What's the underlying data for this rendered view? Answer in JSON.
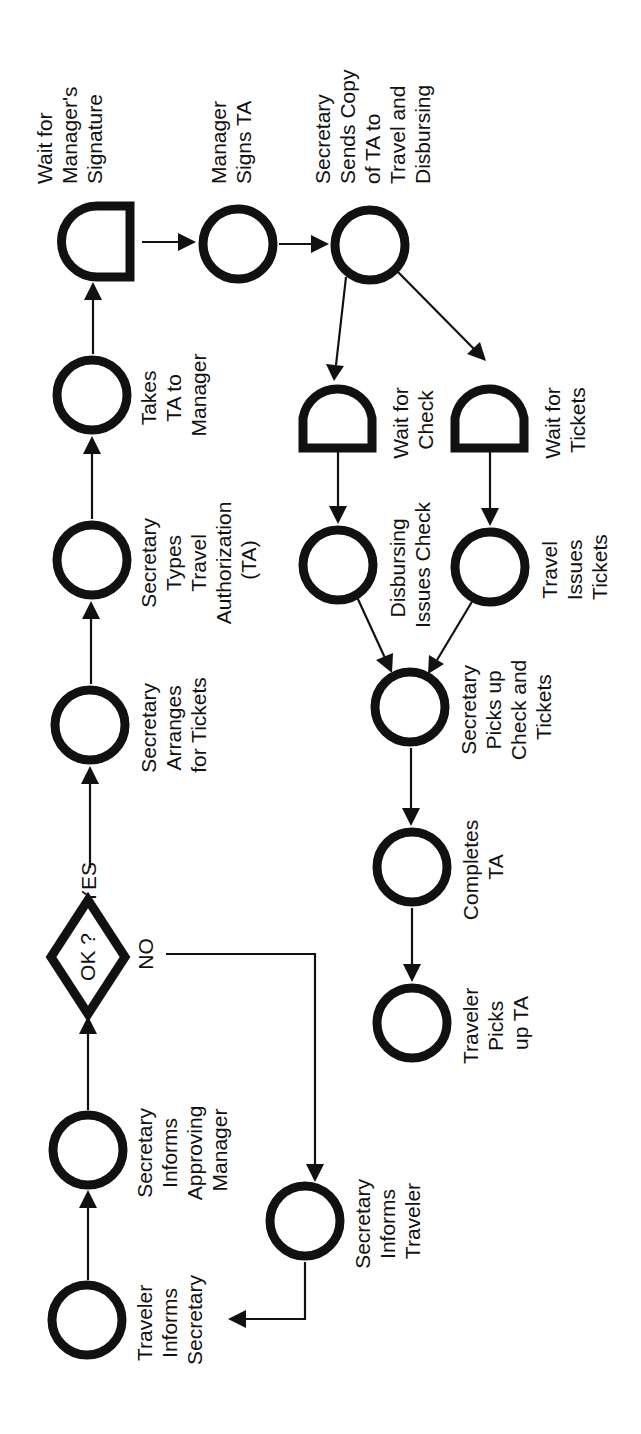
{
  "diagram": {
    "type": "flow-process-chart",
    "orientation": "rotated-90-ccw",
    "colors": {
      "ink": "#111111",
      "background": "#ffffff"
    },
    "nodes": [
      {
        "id": "n1",
        "shape": "circle",
        "lines": [
          "Traveler",
          "Informs",
          "Secretary"
        ]
      },
      {
        "id": "n2",
        "shape": "circle",
        "lines": [
          "Secretary",
          "Informs",
          "Approving",
          "Manager"
        ]
      },
      {
        "id": "d1",
        "shape": "diamond",
        "lines": [
          "OK ?"
        ]
      },
      {
        "id": "n3",
        "shape": "circle",
        "lines": [
          "Secretary",
          "Arranges",
          "for Tickets"
        ]
      },
      {
        "id": "n4",
        "shape": "circle",
        "lines": [
          "Secretary",
          "Types",
          "Travel",
          "Authorization",
          "(TA)"
        ]
      },
      {
        "id": "n5",
        "shape": "circle",
        "lines": [
          "Takes",
          "TA to",
          "Manager"
        ]
      },
      {
        "id": "w1",
        "shape": "delay",
        "lines": [
          "Wait for",
          "Manager's",
          "Signature"
        ]
      },
      {
        "id": "n6",
        "shape": "circle",
        "lines": [
          "Manager",
          "Signs TA"
        ]
      },
      {
        "id": "n7",
        "shape": "circle",
        "lines": [
          "Secretary",
          "Sends Copy",
          "of TA to",
          "Travel and",
          "Disbursing"
        ]
      },
      {
        "id": "w2",
        "shape": "delay",
        "lines": [
          "Wait for",
          "Check"
        ]
      },
      {
        "id": "w3",
        "shape": "delay",
        "lines": [
          "Wait for",
          "Tickets"
        ]
      },
      {
        "id": "n8",
        "shape": "circle",
        "lines": [
          "Disbursing",
          "Issues Check"
        ]
      },
      {
        "id": "n9",
        "shape": "circle",
        "lines": [
          "Travel",
          "Issues",
          "Tickets"
        ]
      },
      {
        "id": "n10",
        "shape": "circle",
        "lines": [
          "Secretary",
          "Picks up",
          "Check and",
          "Tickets"
        ]
      },
      {
        "id": "n11",
        "shape": "circle",
        "lines": [
          "Completes",
          "TA"
        ]
      },
      {
        "id": "n12",
        "shape": "circle",
        "lines": [
          "Traveler",
          "Picks",
          "up TA"
        ]
      },
      {
        "id": "n13",
        "shape": "circle",
        "lines": [
          "Secretary",
          "Informs",
          "Traveler"
        ]
      }
    ],
    "edge_labels": {
      "yes": "YES",
      "no": "NO"
    },
    "edges": [
      {
        "from": "n1",
        "to": "n2"
      },
      {
        "from": "n2",
        "to": "d1"
      },
      {
        "from": "d1",
        "to": "n3",
        "label": "YES"
      },
      {
        "from": "d1",
        "to": "n13",
        "label": "NO"
      },
      {
        "from": "n13",
        "to": "n1"
      },
      {
        "from": "n3",
        "to": "n4"
      },
      {
        "from": "n4",
        "to": "n5"
      },
      {
        "from": "n5",
        "to": "w1"
      },
      {
        "from": "w1",
        "to": "n6"
      },
      {
        "from": "n6",
        "to": "n7"
      },
      {
        "from": "n7",
        "to": "w2"
      },
      {
        "from": "n7",
        "to": "w3"
      },
      {
        "from": "w2",
        "to": "n8"
      },
      {
        "from": "w3",
        "to": "n9"
      },
      {
        "from": "n8",
        "to": "n10"
      },
      {
        "from": "n9",
        "to": "n10"
      },
      {
        "from": "n10",
        "to": "n11"
      },
      {
        "from": "n11",
        "to": "n12"
      }
    ]
  }
}
